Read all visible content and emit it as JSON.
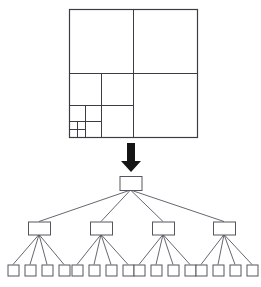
{
  "figure": {
    "background_color": "#ffffff",
    "line_color": "#3c3c46",
    "node_stroke_color": "#55555f",
    "node_fill_color": "#ffffff",
    "arrow_color": "#151515",
    "width": 261,
    "height": 287
  },
  "quadtree_panel": {
    "name": "quadtree-subdivision-diagram",
    "origin_x": 69,
    "origin_y": 9,
    "size": 128,
    "description": "Recursively subdivided square, refined toward the lower-left corner",
    "rects": [
      {
        "id": "root",
        "level": 0,
        "x": 0,
        "y": 0,
        "w": 128,
        "h": 128,
        "stroke_width": 1.2
      },
      {
        "id": "q-nw",
        "level": 1,
        "x": 0,
        "y": 0,
        "w": 64,
        "h": 64,
        "stroke_width": 1.0
      },
      {
        "id": "q-ne",
        "level": 1,
        "x": 64,
        "y": 0,
        "w": 64,
        "h": 64,
        "stroke_width": 1.0
      },
      {
        "id": "q-sw",
        "level": 1,
        "x": 0,
        "y": 64,
        "w": 64,
        "h": 64,
        "stroke_width": 1.0
      },
      {
        "id": "q-se",
        "level": 1,
        "x": 64,
        "y": 64,
        "w": 64,
        "h": 64,
        "stroke_width": 1.0
      },
      {
        "id": "q-sw-nw",
        "level": 2,
        "x": 0,
        "y": 64,
        "w": 32,
        "h": 32,
        "stroke_width": 1.0
      },
      {
        "id": "q-sw-ne",
        "level": 2,
        "x": 32,
        "y": 64,
        "w": 32,
        "h": 32,
        "stroke_width": 1.0
      },
      {
        "id": "q-sw-sw",
        "level": 2,
        "x": 0,
        "y": 96,
        "w": 32,
        "h": 32,
        "stroke_width": 1.0
      },
      {
        "id": "q-sw-se",
        "level": 2,
        "x": 32,
        "y": 96,
        "w": 32,
        "h": 32,
        "stroke_width": 1.0
      },
      {
        "id": "q-sw-sw-nw",
        "level": 3,
        "x": 0,
        "y": 96,
        "w": 16,
        "h": 16,
        "stroke_width": 1.0
      },
      {
        "id": "q-sw-sw-ne",
        "level": 3,
        "x": 16,
        "y": 96,
        "w": 16,
        "h": 16,
        "stroke_width": 1.0
      },
      {
        "id": "q-sw-sw-sw",
        "level": 3,
        "x": 0,
        "y": 112,
        "w": 16,
        "h": 16,
        "stroke_width": 1.0
      },
      {
        "id": "q-sw-sw-se",
        "level": 3,
        "x": 16,
        "y": 112,
        "w": 16,
        "h": 16,
        "stroke_width": 1.0
      },
      {
        "id": "q-sw-sw-sw-nw",
        "level": 4,
        "x": 0,
        "y": 112,
        "w": 8,
        "h": 8,
        "stroke_width": 0.9
      },
      {
        "id": "q-sw-sw-sw-ne",
        "level": 4,
        "x": 8,
        "y": 112,
        "w": 8,
        "h": 8,
        "stroke_width": 0.9
      },
      {
        "id": "q-sw-sw-sw-sw",
        "level": 4,
        "x": 0,
        "y": 120,
        "w": 8,
        "h": 8,
        "stroke_width": 0.9
      },
      {
        "id": "q-sw-sw-sw-se",
        "level": 4,
        "x": 8,
        "y": 120,
        "w": 8,
        "h": 8,
        "stroke_width": 0.9
      }
    ]
  },
  "arrow": {
    "name": "downward-arrow",
    "x": 131,
    "y_top": 143,
    "y_bottom": 172,
    "shaft_width": 8,
    "head_width": 20,
    "head_height": 11
  },
  "tree_panel": {
    "name": "quadtree-node-tree-diagram",
    "levels": [
      {
        "id": "level-0",
        "depth": 0,
        "label": "root",
        "node_count": 1,
        "node_width": 22,
        "node_height": 14,
        "center_y": 183,
        "centers_x": [
          130.5
        ]
      },
      {
        "id": "level-1",
        "depth": 1,
        "label": "children",
        "node_count": 4,
        "node_width": 22,
        "node_height": 13,
        "center_y": 228,
        "centers_x": [
          39,
          101,
          163,
          224
        ]
      },
      {
        "id": "level-2",
        "depth": 2,
        "label": "leaves",
        "node_count": 16,
        "node_width": 11,
        "node_height": 11,
        "center_y": 270,
        "centers_x": [
          13,
          30,
          47,
          64,
          77,
          94,
          111,
          128,
          139,
          156,
          173,
          190,
          201,
          218,
          235,
          252
        ]
      }
    ]
  }
}
